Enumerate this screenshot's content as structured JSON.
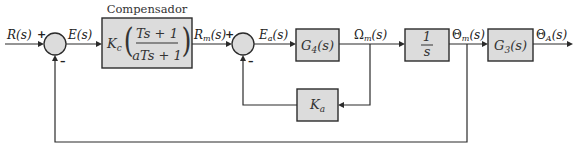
{
  "diagram": {
    "type": "block-diagram",
    "compensator": {
      "title": "Compensador",
      "gain": "K",
      "gain_sub": "c",
      "numerator": "Ts + 1",
      "denominator": "aTs + 1"
    },
    "signals": {
      "R": "R(s)",
      "E": "E(s)",
      "Rm": "R",
      "Rm_sub": "m",
      "Rm_suffix": "(s)",
      "Ea": "E",
      "Ea_sub": "a",
      "Ea_suffix": "(s)",
      "Omega": "Ω",
      "Omega_sub": "m",
      "Omega_suffix": "(s)",
      "Theta_m": "Θ",
      "Theta_m_sub": "m",
      "Theta_m_suffix": "(s)",
      "Theta_A": "Θ",
      "Theta_A_sub": "A",
      "Theta_A_suffix": "(s)"
    },
    "blocks": {
      "G4": {
        "name": "G",
        "sub": "4",
        "suffix": "(s)"
      },
      "Ka": {
        "name": "K",
        "sub": "a"
      },
      "integrator": {
        "numerator": "1",
        "denominator": "s"
      },
      "G3": {
        "name": "G",
        "sub": "3",
        "suffix": "(s)"
      }
    },
    "summing_junctions": [
      {
        "id": "sum1",
        "plus": "+",
        "minus": "–"
      },
      {
        "id": "sum2",
        "plus": "+",
        "minus": "–"
      }
    ]
  }
}
